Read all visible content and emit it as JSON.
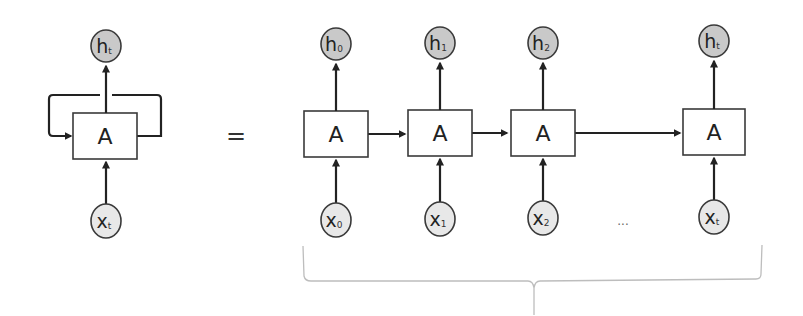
{
  "diagram": {
    "type": "rnn-unrolled",
    "colors": {
      "output_node_fill": "#c9c9c9",
      "input_node_fill": "#e8e8e8",
      "stroke": "#3a3a3a",
      "cell_fill": "#ffffff"
    },
    "folded": {
      "output": {
        "main": "h",
        "sub": "t"
      },
      "cell": {
        "label": "A"
      },
      "input": {
        "main": "x",
        "sub": "t"
      }
    },
    "equals_sign": "=",
    "unrolled": [
      {
        "output": {
          "main": "h",
          "sub": "0"
        },
        "cell": {
          "label": "A"
        },
        "input": {
          "main": "x",
          "sub": "0"
        }
      },
      {
        "output": {
          "main": "h",
          "sub": "1"
        },
        "cell": {
          "label": "A"
        },
        "input": {
          "main": "x",
          "sub": "1"
        }
      },
      {
        "output": {
          "main": "h",
          "sub": "2"
        },
        "cell": {
          "label": "A"
        },
        "input": {
          "main": "x",
          "sub": "2"
        }
      },
      {
        "output": {
          "main": "h",
          "sub": "t"
        },
        "cell": {
          "label": "A"
        },
        "input": {
          "main": "x",
          "sub": "t"
        }
      }
    ],
    "ellipsis": "..."
  }
}
